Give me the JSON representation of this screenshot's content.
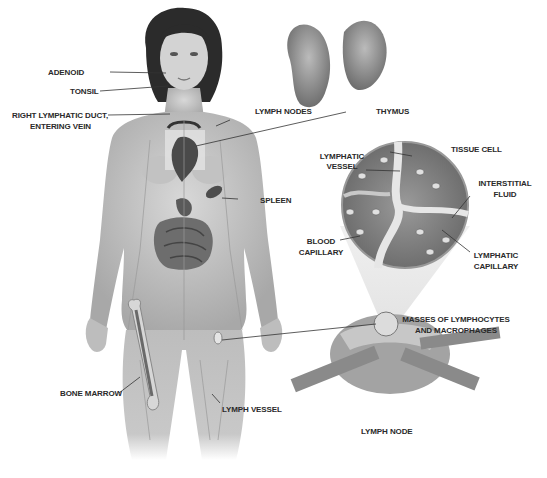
{
  "diagram": {
    "labels": {
      "adenoid": "ADENOID",
      "tonsil": "TONSIL",
      "right_lymphatic_duct_1": "RIGHT LYMPHATIC DUCT,",
      "right_lymphatic_duct_2": "ENTERING VEIN",
      "lymph_nodes": "LYMPH NODES",
      "thymus": "THYMUS",
      "tissue_cell": "TISSUE CELL",
      "lymphatic_vessel_1": "LYMPHATIC",
      "lymphatic_vessel_2": "VESSEL",
      "interstitial_fluid_1": "INTERSTITIAL",
      "interstitial_fluid_2": "FLUID",
      "spleen": "SPLEEN",
      "blood_capillary_1": "BLOOD",
      "blood_capillary_2": "CAPILLARY",
      "lymphatic_capillary_1": "LYMPHATIC",
      "lymphatic_capillary_2": "CAPILLARY",
      "masses_1": "MASSES OF LYMPHOCYTES",
      "masses_2": "AND MACROPHAGES",
      "bone_marrow": "BONE MARROW",
      "lymph_vessel": "LYMPH VESSEL",
      "lymph_node": "LYMPH NODE"
    },
    "colors": {
      "skin": "#c9c9c9",
      "skin_dark": "#a9a9a9",
      "hair": "#2b2b2b",
      "organ": "#5a5a5a",
      "tissue": "#8a8a8a",
      "label_text": "#2a2a2a"
    }
  }
}
